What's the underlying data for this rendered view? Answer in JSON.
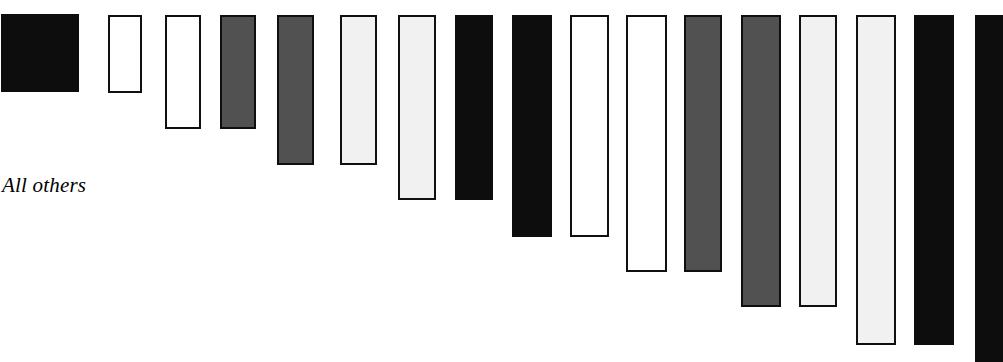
{
  "chart_data": {
    "type": "bar",
    "title": "",
    "subtitle": "",
    "xlabel": "",
    "ylabel": "",
    "orientation": "vertical-hanging",
    "grid": false,
    "legend": null,
    "axis_visible": false,
    "bars_anchored": "top",
    "annotations": [
      {
        "name": "all-others",
        "text": "All others",
        "x": 2,
        "y": 175,
        "style": "italic-serif"
      }
    ],
    "categories": [
      "bar-1",
      "bar-2",
      "bar-3",
      "bar-4",
      "bar-5",
      "bar-6",
      "bar-7",
      "bar-8",
      "bar-9",
      "bar-10",
      "bar-11",
      "bar-12",
      "bar-13",
      "bar-14",
      "bar-15",
      "bar-16",
      "bar-17"
    ],
    "values": [
      92,
      78,
      113,
      113,
      150,
      150,
      185,
      185,
      220,
      220,
      255,
      255,
      292,
      292,
      330,
      330,
      362
    ],
    "ylim": [
      0,
      362
    ],
    "fills": [
      "black",
      "white",
      "white",
      "darkgray",
      "darkgray",
      "lightgray",
      "lightgray",
      "black",
      "black",
      "white",
      "white",
      "darkgray",
      "darkgray",
      "lightgray",
      "lightgray",
      "black",
      "black"
    ],
    "colors": {
      "black": "#0d0d0d",
      "white": "#ffffff",
      "darkgray": "#515151",
      "lightgray": "#f1f1f1",
      "outline": "#101010",
      "background": "#ffffff",
      "text": "#000000"
    },
    "bars": [
      {
        "label": "bar-1",
        "fill": "black",
        "x": 1,
        "width": 78,
        "top": 14,
        "bottom": 92,
        "length": 78
      },
      {
        "label": "bar-2",
        "fill": "white",
        "x": 108,
        "width": 34,
        "top": 15,
        "bottom": 93,
        "length": 78
      },
      {
        "label": "bar-3",
        "fill": "white",
        "x": 165,
        "width": 36,
        "top": 15,
        "bottom": 129,
        "length": 114
      },
      {
        "label": "bar-4",
        "fill": "darkgray",
        "x": 220,
        "width": 36,
        "top": 15,
        "bottom": 129,
        "length": 114
      },
      {
        "label": "bar-5",
        "fill": "darkgray",
        "x": 277,
        "width": 37,
        "top": 15,
        "bottom": 165,
        "length": 150
      },
      {
        "label": "bar-6",
        "fill": "lightgray",
        "x": 340,
        "width": 37,
        "top": 15,
        "bottom": 165,
        "length": 150
      },
      {
        "label": "bar-7",
        "fill": "lightgray",
        "x": 398,
        "width": 38,
        "top": 15,
        "bottom": 200,
        "length": 185
      },
      {
        "label": "bar-8",
        "fill": "black",
        "x": 455,
        "width": 38,
        "top": 15,
        "bottom": 200,
        "length": 185
      },
      {
        "label": "bar-9",
        "fill": "black",
        "x": 512,
        "width": 40,
        "top": 15,
        "bottom": 237,
        "length": 222
      },
      {
        "label": "bar-10",
        "fill": "white",
        "x": 570,
        "width": 39,
        "top": 15,
        "bottom": 237,
        "length": 222
      },
      {
        "label": "bar-11",
        "fill": "white",
        "x": 626,
        "width": 41,
        "top": 15,
        "bottom": 272,
        "length": 257
      },
      {
        "label": "bar-12",
        "fill": "darkgray",
        "x": 684,
        "width": 38,
        "top": 15,
        "bottom": 272,
        "length": 257
      },
      {
        "label": "bar-13",
        "fill": "darkgray",
        "x": 741,
        "width": 40,
        "top": 15,
        "bottom": 307,
        "length": 292
      },
      {
        "label": "bar-14",
        "fill": "lightgray",
        "x": 799,
        "width": 38,
        "top": 15,
        "bottom": 307,
        "length": 292
      },
      {
        "label": "bar-15",
        "fill": "lightgray",
        "x": 856,
        "width": 40,
        "top": 15,
        "bottom": 345,
        "length": 330
      },
      {
        "label": "bar-16",
        "fill": "black",
        "x": 914,
        "width": 40,
        "top": 15,
        "bottom": 345,
        "length": 330
      },
      {
        "label": "bar-17",
        "fill": "black",
        "x": 975,
        "width": 28,
        "top": 15,
        "bottom": 362,
        "length": 347
      }
    ]
  }
}
